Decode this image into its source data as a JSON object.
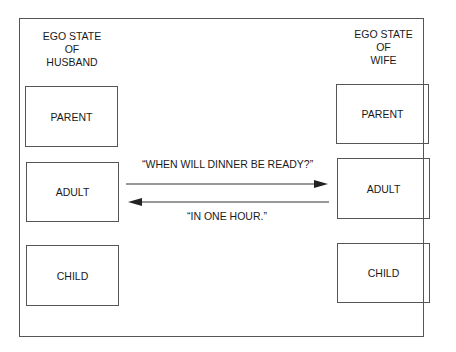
{
  "diagram": {
    "husband": {
      "heading_lines": [
        "EGO STATE",
        "OF",
        "HUSBAND"
      ],
      "states": [
        "PARENT",
        "ADULT",
        "CHILD"
      ]
    },
    "wife": {
      "heading_lines": [
        "EGO STATE",
        "OF",
        "WIFE"
      ],
      "states": [
        "PARENT",
        "ADULT",
        "CHILD"
      ]
    },
    "transactions": [
      {
        "from": "husband.ADULT",
        "to": "wife.ADULT",
        "label": "“WHEN WILL DINNER BE READY?”"
      },
      {
        "from": "wife.ADULT",
        "to": "husband.ADULT",
        "label": "“IN ONE HOUR.”"
      }
    ]
  }
}
